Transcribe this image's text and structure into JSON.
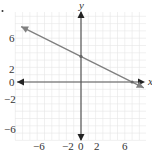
{
  "chart_data": {
    "type": "line",
    "title": "",
    "xlabel": "x",
    "ylabel": "y",
    "xlim": [
      -9,
      9
    ],
    "ylim": [
      -9,
      9
    ],
    "grid": true,
    "x_ticks": [
      -6,
      -2,
      0,
      2,
      6
    ],
    "y_ticks": [
      6,
      2,
      0,
      -2,
      -6
    ],
    "series": [
      {
        "name": "line",
        "equation": "y = -0.5x + 3.5",
        "slope": -0.5,
        "intercept": 3.5,
        "x": [
          -8.2,
          0,
          7,
          8.6
        ],
        "y": [
          7.6,
          3.5,
          0,
          -0.8
        ],
        "marked_points": [
          [
            0,
            3.5
          ],
          [
            7,
            0
          ]
        ],
        "arrows_both_ends": true,
        "color": "#777777"
      }
    ]
  },
  "labels": {
    "x_axis": "x",
    "y_axis": "y",
    "x_ticks": [
      "−6",
      "−2",
      "0",
      "2",
      "6"
    ],
    "y_ticks": [
      "6",
      "2",
      "0",
      "−2",
      "−6"
    ]
  },
  "colors": {
    "grid": "#e6e6e6",
    "axis": "#555555",
    "line": "#808080",
    "arrow": "#222222"
  }
}
